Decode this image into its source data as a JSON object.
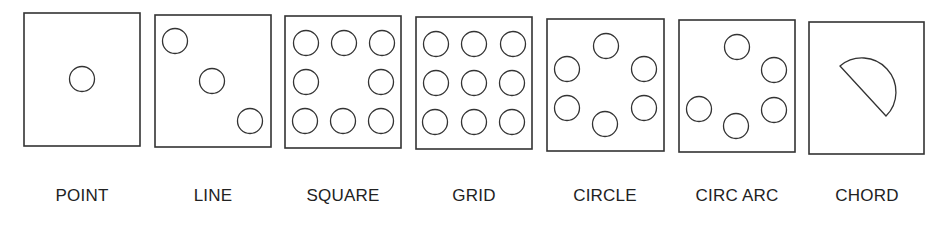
{
  "figure": {
    "stroke_color": "#333333",
    "panels": [
      {
        "id": "point",
        "label": "POINT",
        "box": {
          "x": 24,
          "y": 13,
          "w": 116,
          "h": 133
        },
        "circles": [
          [
            82,
            79
          ]
        ]
      },
      {
        "id": "line",
        "label": "LINE",
        "box": {
          "x": 155,
          "y": 15,
          "w": 116,
          "h": 132
        },
        "circles": [
          [
            175,
            41
          ],
          [
            212,
            81
          ],
          [
            250,
            121
          ]
        ]
      },
      {
        "id": "square",
        "label": "SQUARE",
        "box": {
          "x": 285,
          "y": 16,
          "w": 116,
          "h": 132
        },
        "circles": [
          [
            306,
            43
          ],
          [
            344,
            43
          ],
          [
            382,
            43
          ],
          [
            306,
            82
          ],
          [
            381,
            82
          ],
          [
            305,
            121
          ],
          [
            343,
            121
          ],
          [
            381,
            121
          ]
        ]
      },
      {
        "id": "grid",
        "label": "GRID",
        "box": {
          "x": 416,
          "y": 17,
          "w": 116,
          "h": 132
        },
        "circles": [
          [
            436,
            44
          ],
          [
            474,
            44
          ],
          [
            513,
            44
          ],
          [
            436,
            83
          ],
          [
            474,
            83
          ],
          [
            512,
            83
          ],
          [
            435,
            122
          ],
          [
            474,
            122
          ],
          [
            512,
            122
          ]
        ]
      },
      {
        "id": "circle",
        "label": "CIRCLE",
        "box": {
          "x": 547,
          "y": 19,
          "w": 117,
          "h": 132
        },
        "circles": [
          [
            606,
            46
          ],
          [
            567,
            69
          ],
          [
            644,
            69
          ],
          [
            567,
            108
          ],
          [
            644,
            108
          ],
          [
            605,
            124
          ]
        ]
      },
      {
        "id": "circ-arc",
        "label": "CIRC ARC",
        "box": {
          "x": 679,
          "y": 20,
          "w": 116,
          "h": 132
        },
        "circles": [
          [
            737,
            47
          ],
          [
            774,
            70
          ],
          [
            699,
            109
          ],
          [
            774,
            110
          ],
          [
            736,
            126
          ]
        ]
      },
      {
        "id": "chord",
        "label": "CHORD",
        "box": {
          "x": 809,
          "y": 22,
          "w": 115,
          "h": 132
        },
        "chord": {
          "start": [
            840,
            66
          ],
          "end": [
            886,
            116
          ],
          "radius": 34
        }
      }
    ]
  }
}
